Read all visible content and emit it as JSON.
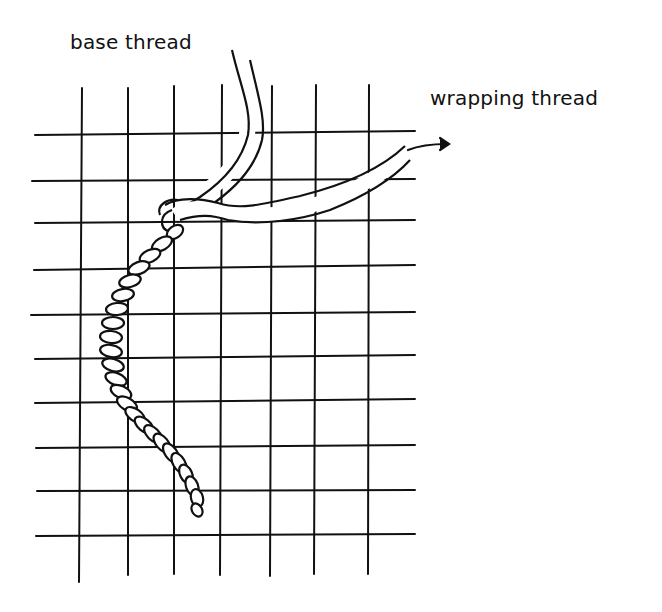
{
  "diagram": {
    "type": "illustration",
    "labels": {
      "base_thread": "base thread",
      "wrapping_thread": "wrapping thread"
    },
    "grid": {
      "vertical_lines": 7,
      "horizontal_lines": 10,
      "line_color": "#111111"
    },
    "elements": [
      {
        "name": "base-thread",
        "description": "two parallel strands descending from top, curving down-left into wrapped cord"
      },
      {
        "name": "wrapping-thread",
        "description": "strand looping around base thread and extending right with an arrow"
      },
      {
        "name": "wrapped-cord",
        "description": "twisted rope segment curving down along left side of grid"
      },
      {
        "name": "direction-arrow",
        "description": "arrow pointing right at end of wrapping thread"
      }
    ],
    "colors": {
      "ink": "#111111",
      "background": "#ffffff"
    }
  }
}
